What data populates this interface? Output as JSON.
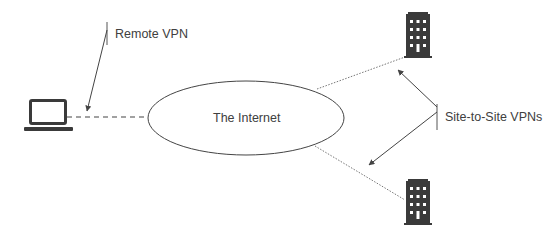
{
  "diagram": {
    "nodes": {
      "internet": {
        "label": "The Internet"
      },
      "laptop": {
        "icon": "laptop-icon"
      },
      "building_top": {
        "icon": "building-icon"
      },
      "building_bottom": {
        "icon": "building-icon"
      }
    },
    "annotations": {
      "remote_vpn": "Remote VPN",
      "site_to_site": "Site-to-Site VPNs"
    },
    "colors": {
      "line": "#555555",
      "text": "#404040",
      "icon": "#3a3a3a"
    }
  }
}
